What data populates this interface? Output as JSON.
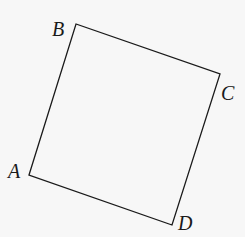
{
  "diagram": {
    "shape": "square",
    "stroke_color": "#1a1a1a",
    "background": "#f7f7f7",
    "vertices": [
      {
        "name": "A",
        "x": 29,
        "y": 175,
        "label_x": 8,
        "label_y": 178
      },
      {
        "name": "B",
        "x": 76,
        "y": 24,
        "label_x": 52,
        "label_y": 36
      },
      {
        "name": "C",
        "x": 220,
        "y": 74,
        "label_x": 221,
        "label_y": 100
      },
      {
        "name": "D",
        "x": 172,
        "y": 225,
        "label_x": 178,
        "label_y": 230
      }
    ],
    "labels": {
      "A": "A",
      "B": "B",
      "C": "C",
      "D": "D"
    }
  }
}
